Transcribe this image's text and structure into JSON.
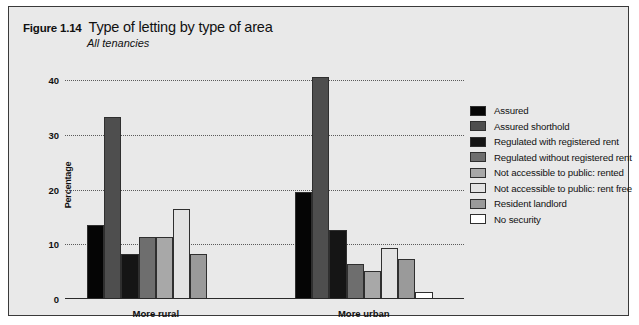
{
  "figure": {
    "number": "Figure 1.14",
    "title": "Type of letting by type of area",
    "subtitle": "All tenancies"
  },
  "chart_data": {
    "type": "bar",
    "title": "Type of letting by type of area",
    "subtitle": "All tenancies",
    "xlabel": "",
    "ylabel": "Percentage",
    "ylim": [
      0,
      40
    ],
    "yticks": [
      0,
      10,
      20,
      30,
      40
    ],
    "grid": true,
    "legend_position": "right",
    "categories": [
      "More rural",
      "More urban"
    ],
    "series": [
      {
        "name": "Assured",
        "color": "#050505",
        "values": [
          13.5,
          19.5
        ]
      },
      {
        "name": "Assured shorthold",
        "color": "#4e4e4e",
        "values": [
          33.2,
          40.5
        ]
      },
      {
        "name": "Regulated with registered rent",
        "color": "#151515",
        "values": [
          8.2,
          12.6
        ]
      },
      {
        "name": "Regulated without registered rent",
        "color": "#6e6e6e",
        "values": [
          11.4,
          6.4
        ]
      },
      {
        "name": "Not accessible to public: rented",
        "color": "#a8a8a8",
        "values": [
          11.4,
          5.2
        ]
      },
      {
        "name": "Not accessible to public: rent free",
        "color": "#e3e3e3",
        "values": [
          16.4,
          9.4
        ]
      },
      {
        "name": "Resident landlord",
        "color": "#9a9a9a",
        "values": [
          8.2,
          7.3
        ]
      },
      {
        "name": "No security",
        "color": "#ffffff",
        "values": [
          0.2,
          1.2
        ]
      }
    ]
  }
}
